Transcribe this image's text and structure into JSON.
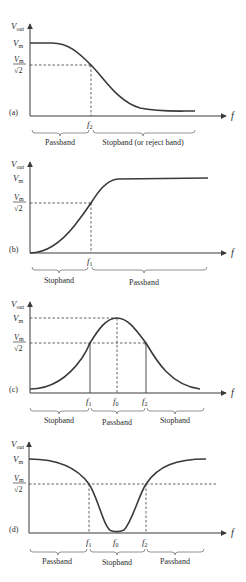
{
  "figure": {
    "axis_labels": {
      "y": "V",
      "y_sub": "out",
      "x": "f"
    },
    "level_labels": {
      "vm": "V",
      "vm_sub": "m",
      "vm_root2_num": "V",
      "vm_root2_sub": "m",
      "vm_root2_den": "√2"
    },
    "panels": [
      {
        "id": "a",
        "tag": "(a)",
        "filter_type": "low-pass",
        "freq_markers": [
          {
            "label": "f",
            "sub": "2"
          }
        ],
        "bands": [
          "Passband",
          "Stopband (or reject band)"
        ]
      },
      {
        "id": "b",
        "tag": "(b)",
        "filter_type": "high-pass",
        "freq_markers": [
          {
            "label": "f",
            "sub": "1"
          }
        ],
        "bands": [
          "Stopband",
          "Passband"
        ]
      },
      {
        "id": "c",
        "tag": "(c)",
        "filter_type": "band-pass",
        "freq_markers": [
          {
            "label": "f",
            "sub": "1"
          },
          {
            "label": "f",
            "sub": "0"
          },
          {
            "label": "f",
            "sub": "2"
          }
        ],
        "bands": [
          "Stopband",
          "Passband",
          "Stopband"
        ]
      },
      {
        "id": "d",
        "tag": "(d)",
        "filter_type": "band-stop",
        "freq_markers": [
          {
            "label": "f",
            "sub": "1"
          },
          {
            "label": "f",
            "sub": "0"
          },
          {
            "label": "f",
            "sub": "2"
          }
        ],
        "bands": [
          "Passband",
          "Stopband",
          "Passband"
        ]
      }
    ]
  }
}
